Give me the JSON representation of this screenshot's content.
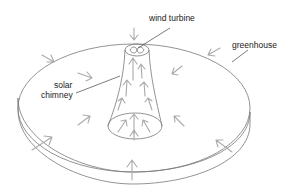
{
  "diagram": {
    "type": "solar-updraft-tower",
    "labels": {
      "wind_turbine": "wind turbine",
      "greenhouse": "greenhouse",
      "solar_chimney_line1": "solar",
      "solar_chimney_line2": "chimney"
    },
    "colors": {
      "outline": "#777777",
      "arrows": "#aaaaaa",
      "text": "#222222",
      "background": "#ffffff"
    }
  }
}
